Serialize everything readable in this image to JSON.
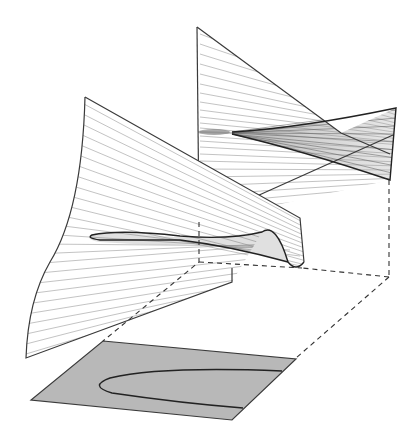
{
  "figure": {
    "colors": {
      "background": "#ffffff",
      "edge": "#3a3a3a",
      "hatch": "#9a9a9a",
      "plane_fill": "#b8b8b8",
      "curve": "#222222",
      "dash": "#333333"
    },
    "elements": {
      "back_surface": "back-sheet",
      "front_surface": "front-fold-sheet",
      "control_plane": "shaded-control-plane",
      "bifurcation_curve": "cusp-curve",
      "projection_lines": "dashed-projection-lines"
    }
  }
}
